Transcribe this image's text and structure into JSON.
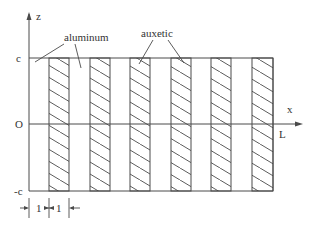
{
  "diagram": {
    "type": "layered composite cross-section",
    "axes": {
      "vertical_label": "z",
      "horizontal_label": "x",
      "top_label": "c",
      "origin_label": "O",
      "bottom_label": "-c",
      "length_label": "L"
    },
    "materials": {
      "hatched_label": "aluminum",
      "plain_label": "auxetic"
    },
    "dimension": {
      "left_value": "1",
      "right_value": "1"
    },
    "strips": [
      {
        "x": 49,
        "w": 20,
        "hatched": true
      },
      {
        "x": 90,
        "w": 20,
        "hatched": true
      },
      {
        "x": 130,
        "w": 20,
        "hatched": true
      },
      {
        "x": 171,
        "w": 20,
        "hatched": true
      },
      {
        "x": 211,
        "w": 20,
        "hatched": true
      },
      {
        "x": 252,
        "w": 21,
        "hatched": true
      }
    ],
    "colors": {
      "line": "#4a4a4a",
      "text": "#333333",
      "background": "#ffffff"
    }
  }
}
